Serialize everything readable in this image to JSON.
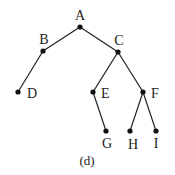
{
  "diagram": {
    "type": "tree",
    "caption": "(d)",
    "nodes": [
      {
        "id": "A",
        "label": "A",
        "x": 80,
        "y": 27,
        "lx": 80,
        "ly": 20,
        "anchor": "middle"
      },
      {
        "id": "B",
        "label": "B",
        "x": 43,
        "y": 51,
        "lx": 44,
        "ly": 44,
        "anchor": "middle"
      },
      {
        "id": "C",
        "label": "C",
        "x": 118,
        "y": 52,
        "lx": 119,
        "ly": 45,
        "anchor": "middle"
      },
      {
        "id": "D",
        "label": "D",
        "x": 18,
        "y": 92,
        "lx": 27,
        "ly": 98,
        "anchor": "start"
      },
      {
        "id": "E",
        "label": "E",
        "x": 93,
        "y": 92,
        "lx": 101,
        "ly": 98,
        "anchor": "start"
      },
      {
        "id": "F",
        "label": "F",
        "x": 143,
        "y": 92,
        "lx": 151,
        "ly": 98,
        "anchor": "start"
      },
      {
        "id": "G",
        "label": "G",
        "x": 106,
        "y": 131,
        "lx": 107,
        "ly": 148,
        "anchor": "middle"
      },
      {
        "id": "H",
        "label": "H",
        "x": 130,
        "y": 131,
        "lx": 133,
        "ly": 149,
        "anchor": "middle"
      },
      {
        "id": "I",
        "label": "I",
        "x": 156,
        "y": 131,
        "lx": 156,
        "ly": 148,
        "anchor": "middle"
      }
    ],
    "edges": [
      [
        "A",
        "B"
      ],
      [
        "A",
        "C"
      ],
      [
        "B",
        "D"
      ],
      [
        "C",
        "E"
      ],
      [
        "C",
        "F"
      ],
      [
        "E",
        "G"
      ],
      [
        "F",
        "H"
      ],
      [
        "F",
        "I"
      ]
    ]
  }
}
